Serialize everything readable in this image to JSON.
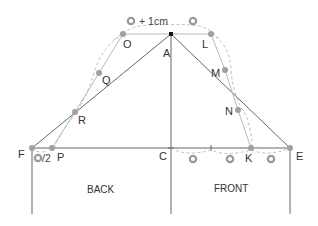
{
  "diagram": {
    "colors": {
      "line": "#555555",
      "guide": "#aaaaaa",
      "dashed": "#b5b5b5",
      "point": "#a0a0a0",
      "apex": "#111111",
      "text": "#333333"
    },
    "points": {
      "A": {
        "label": "A",
        "x": 171,
        "y": 34
      },
      "O": {
        "label": "O",
        "x": 123,
        "y": 34
      },
      "L": {
        "label": "L",
        "x": 211,
        "y": 34
      },
      "Q": {
        "label": "Q",
        "x": 99,
        "y": 73
      },
      "M": {
        "label": "M",
        "x": 225,
        "y": 70
      },
      "R": {
        "label": "R",
        "x": 75,
        "y": 112
      },
      "N": {
        "label": "N",
        "x": 238,
        "y": 110
      },
      "F": {
        "label": "F",
        "x": 32,
        "y": 148
      },
      "P": {
        "label": "P",
        "x": 52,
        "y": 148
      },
      "C": {
        "label": "C",
        "x": 171,
        "y": 148
      },
      "K": {
        "label": "K",
        "x": 251,
        "y": 148
      },
      "E": {
        "label": "E",
        "x": 290,
        "y": 148
      }
    },
    "annotations": {
      "top_note": "+ 1cm",
      "half_note": "/2"
    },
    "regions": {
      "back": "BACK",
      "front": "FRONT"
    }
  }
}
